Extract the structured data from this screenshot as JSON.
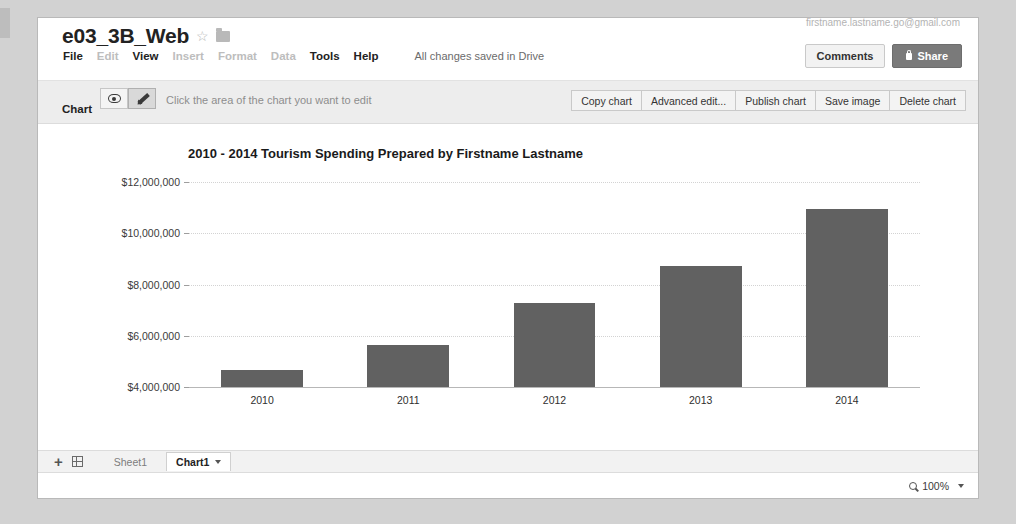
{
  "header": {
    "doc_title": "e03_3B_Web",
    "star_icon": "star-icon",
    "folder_icon": "folder-icon",
    "account_email": "firstname.lastname.go@gmail.com",
    "menu": [
      {
        "label": "File",
        "enabled": true
      },
      {
        "label": "Edit",
        "enabled": false
      },
      {
        "label": "View",
        "enabled": true
      },
      {
        "label": "Insert",
        "enabled": false
      },
      {
        "label": "Format",
        "enabled": false
      },
      {
        "label": "Data",
        "enabled": false
      },
      {
        "label": "Tools",
        "enabled": true
      },
      {
        "label": "Help",
        "enabled": true
      }
    ],
    "save_status": "All changes saved in Drive",
    "comments_label": "Comments",
    "share_label": "Share"
  },
  "chart_toolbar": {
    "panel_label": "Chart",
    "view_mode_icon": "eye-icon",
    "edit_mode_icon": "pencil-icon",
    "hint": "Click the area of the chart you want to edit",
    "actions": [
      "Copy chart",
      "Advanced edit...",
      "Publish chart",
      "Save image",
      "Delete chart"
    ]
  },
  "chart_data": {
    "type": "bar",
    "title": "2010 - 2014 Tourism Spending Prepared by Firstname Lastname",
    "xlabel": "",
    "ylabel": "",
    "categories": [
      "2010",
      "2011",
      "2012",
      "2013",
      "2014"
    ],
    "values": [
      4650000,
      5640000,
      7280000,
      8720000,
      10960000
    ],
    "ylim": [
      4000000,
      12000000
    ],
    "yticks": [
      4000000,
      6000000,
      8000000,
      10000000,
      12000000
    ],
    "ytick_labels": [
      "$4,000,000",
      "$6,000,000",
      "$8,000,000",
      "$10,000,000",
      "$12,000,000"
    ],
    "grid": true,
    "legend": "none",
    "bar_color": "#616161"
  },
  "sheetbar": {
    "add_sheet_icon": "plus-icon",
    "all_sheets_icon": "grid-icon",
    "tabs": [
      {
        "label": "Sheet1",
        "active": false
      },
      {
        "label": "Chart1",
        "active": true
      }
    ]
  },
  "statusbar": {
    "zoom_icon": "magnifier-icon",
    "zoom_level": "100%"
  }
}
